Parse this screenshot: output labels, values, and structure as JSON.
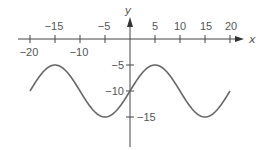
{
  "chart_data": {
    "type": "line",
    "title": "",
    "xlabel": "x",
    "ylabel": "y",
    "xlim": [
      -20,
      20
    ],
    "ylim": [
      -20,
      0
    ],
    "grid": false,
    "legend": null,
    "function": "y = -10 + 5 sin(pi (x + 20) / 10)",
    "x_ticks_top": [
      "-15",
      "-5",
      "5",
      "10",
      "15",
      "20"
    ],
    "x_ticks_bottom": [
      "-20",
      "-10"
    ],
    "y_ticks": [
      "-5",
      "-10",
      "-15"
    ],
    "series": [
      {
        "name": "curve",
        "x": [
          -20,
          -17.5,
          -15,
          -12.5,
          -10,
          -7.5,
          -5,
          -2.5,
          0,
          2.5,
          5,
          7.5,
          10,
          12.5,
          15,
          17.5,
          20
        ],
        "y": [
          -10,
          -6.46,
          -5,
          -6.46,
          -10,
          -13.54,
          -15,
          -13.54,
          -10,
          -6.46,
          -5,
          -6.46,
          -10,
          -13.54,
          -15,
          -13.54,
          -10
        ]
      }
    ],
    "colors": {
      "curve": "#666666",
      "axes": "#444444",
      "text": "#555555"
    }
  },
  "labels": {
    "x_axis": "x",
    "y_axis": "y",
    "xt": {
      "m20": "−20",
      "m15": "−15",
      "m10": "−10",
      "m5": "−5",
      "p5": "5",
      "p10": "10",
      "p15": "15",
      "p20": "20"
    },
    "yt": {
      "m5": "−5",
      "m10": "−10",
      "m15": "−15"
    }
  }
}
